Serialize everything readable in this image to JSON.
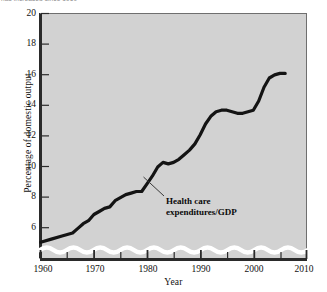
{
  "caption": {
    "text": "has increased since 1960"
  },
  "chart_data": {
    "type": "line",
    "title": "",
    "xlabel": "Year",
    "ylabel": "Percentage of domestic output",
    "xlim": [
      1960,
      2010
    ],
    "ylim": [
      5,
      20
    ],
    "grid": false,
    "legend_position": "inline-annotation",
    "axis_break": "y-axis broken below 6 (wavy band)",
    "background_color": "#d2d2d2",
    "line_color": "#111111",
    "frame_color": "#2a2a2a",
    "x_ticks": [
      1960,
      1970,
      1980,
      1990,
      2000,
      2010
    ],
    "x_tick_labels": [
      "1960",
      "1970",
      "1980",
      "1990",
      "2000",
      "2010"
    ],
    "x_minor_tick_interval": 5,
    "y_ticks": [
      6,
      8,
      10,
      12,
      14,
      16,
      18,
      20
    ],
    "y_tick_labels": [
      "6",
      "8",
      "10",
      "12",
      "14",
      "16",
      "18",
      "20"
    ],
    "series": [
      {
        "name": "Health care expenditures/GDP",
        "annotation": "Health care expenditures/GDP",
        "annotation_line_1": "Health care",
        "annotation_line_2": "expenditures/GDP",
        "x": [
          1960,
          1962,
          1964,
          1965,
          1966,
          1967,
          1968,
          1969,
          1970,
          1971,
          1972,
          1973,
          1974,
          1975,
          1976,
          1977,
          1978,
          1979,
          1980,
          1981,
          1982,
          1983,
          1984,
          1985,
          1986,
          1987,
          1988,
          1989,
          1990,
          1991,
          1992,
          1993,
          1994,
          1995,
          1996,
          1997,
          1998,
          1999,
          2000,
          2001,
          2002,
          2003,
          2004,
          2005,
          2006
        ],
        "y": [
          5.1,
          5.3,
          5.5,
          5.6,
          5.7,
          6.0,
          6.3,
          6.5,
          6.9,
          7.1,
          7.3,
          7.4,
          7.8,
          8.0,
          8.2,
          8.3,
          8.4,
          8.4,
          8.9,
          9.4,
          10.0,
          10.3,
          10.2,
          10.3,
          10.5,
          10.8,
          11.1,
          11.5,
          12.1,
          12.8,
          13.3,
          13.6,
          13.7,
          13.7,
          13.6,
          13.5,
          13.5,
          13.6,
          13.7,
          14.3,
          15.2,
          15.8,
          16.0,
          16.1,
          16.1
        ],
        "start_value": 5.1,
        "end_value": 16.1,
        "notable_points": [
          {
            "year": 1960,
            "value": 5.1,
            "note": "series start"
          },
          {
            "year": 1972,
            "value": 7.3,
            "note": "short plateau"
          },
          {
            "year": 1979,
            "value": 8.4,
            "note": "plateau"
          },
          {
            "year": 1983,
            "value": 10.3,
            "note": "local peak before dip"
          },
          {
            "year": 1984,
            "value": 10.2,
            "note": "small dip"
          },
          {
            "year": 1993,
            "value": 13.6,
            "note": "start of 1990s plateau"
          },
          {
            "year": 1997,
            "value": 13.5,
            "note": "plateau low"
          },
          {
            "year": 2000,
            "value": 13.7,
            "note": "end of plateau"
          },
          {
            "year": 2005,
            "value": 16.1,
            "note": "series end"
          }
        ]
      }
    ]
  }
}
